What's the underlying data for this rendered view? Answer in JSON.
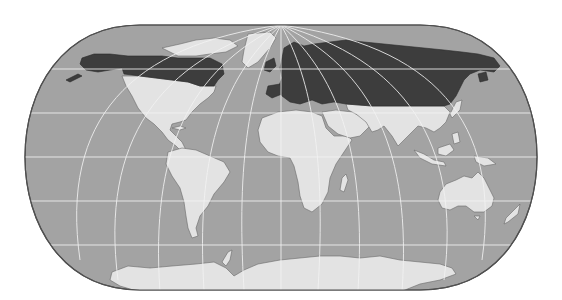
{
  "map": {
    "projection": "pseudo-cylindrical world map (rounded outline)",
    "style": "grayscale",
    "colors": {
      "background": "#ffffff",
      "ocean": "#a3a3a3",
      "outline": "#505050",
      "graticule": "#f2f2f2",
      "land_default": "#e3e3e3",
      "land_highlight": "#3d3d3d"
    },
    "highlighted_regions": [
      "Alaska",
      "Canada",
      "Northern Europe",
      "Russia"
    ],
    "unhighlighted_regions": [
      "Greenland",
      "United States",
      "Central America",
      "South America",
      "Africa",
      "Middle East",
      "South Asia",
      "East Asia",
      "Southeast Asia",
      "Australia",
      "New Zealand",
      "Antarctica"
    ],
    "graticule": {
      "parallels_y": [
        69,
        113,
        157,
        201,
        245
      ],
      "meridian_count": 12
    },
    "text_labels": []
  }
}
